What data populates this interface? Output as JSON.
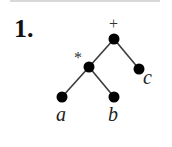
{
  "problem": {
    "number": "1."
  },
  "tree": {
    "root": {
      "operator": "+"
    },
    "internal": {
      "operator": "*"
    },
    "leaves": [
      {
        "label": "a"
      },
      {
        "label": "b"
      },
      {
        "label": "c"
      }
    ],
    "colors": {
      "node": "#000000",
      "edge": "#3a3a3a"
    }
  }
}
